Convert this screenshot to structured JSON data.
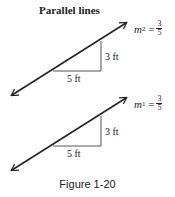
{
  "title": "Parallel lines",
  "lines": [
    {
      "name": "line-2",
      "slope_var": "m",
      "slope_sub": "2",
      "slope_num": "3",
      "slope_den": "5",
      "run_label": "5 ft",
      "rise_label": "3 ft"
    },
    {
      "name": "line-1",
      "slope_var": "m",
      "slope_sub": "1",
      "slope_num": "3",
      "slope_den": "5",
      "run_label": "5 ft",
      "rise_label": "3 ft"
    }
  ],
  "caption": "Figure 1-20",
  "colors": {
    "line": "#222222",
    "triangle": "#555555"
  }
}
